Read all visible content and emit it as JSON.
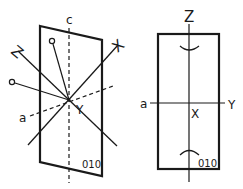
{
  "figure": {
    "left_view": {
      "face_label": "010",
      "axis_labels": {
        "c": "c",
        "a": "a",
        "Z": "Z",
        "X": "X",
        "Y": "Y"
      },
      "optic_axis_markers": [
        "o",
        "o"
      ]
    },
    "right_view": {
      "face_label": "010",
      "axis_labels": {
        "Z": "Z",
        "a": "a",
        "Y": "Y",
        "X": "X"
      }
    },
    "colors": {
      "ink": "#1a1a1a",
      "background": "#ffffff"
    }
  }
}
